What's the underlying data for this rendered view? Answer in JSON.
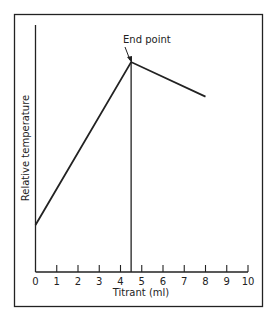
{
  "chart_data": {
    "type": "line",
    "title": "",
    "xlabel": "Titrant (ml)",
    "ylabel": "Relative temperature",
    "xlim": [
      0,
      10
    ],
    "ylim": [
      0,
      1
    ],
    "x_ticks": [
      "0",
      "1",
      "2",
      "3",
      "4",
      "5",
      "6",
      "7",
      "8",
      "9",
      "10"
    ],
    "y_ticks": [],
    "grid": false,
    "legend": null,
    "series": [
      {
        "name": "Thermometric titration curve",
        "x": [
          0,
          4.5,
          8
        ],
        "y": [
          0.19,
          0.85,
          0.71
        ]
      }
    ],
    "annotations": [
      {
        "text": "End point",
        "x": 4.5,
        "y": 0.85,
        "arrow": true
      },
      {
        "type": "vertical_line",
        "x": 4.5,
        "from_y": 0,
        "to_y": 0.85
      }
    ]
  }
}
